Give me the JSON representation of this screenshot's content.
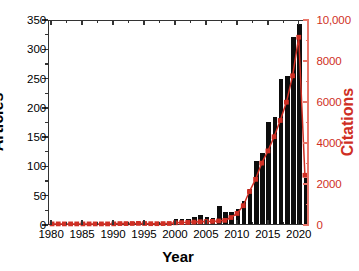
{
  "chart_data": {
    "type": "bar",
    "title": "",
    "xlabel": "Year",
    "ylabel": "Articles",
    "y2label": "Citations",
    "grid": false,
    "legend": "none",
    "xlim": [
      1979.5,
      2021.5
    ],
    "ylim": [
      0,
      350
    ],
    "y2lim": [
      0,
      10000
    ],
    "x_ticks": [
      "1980",
      "1985",
      "1990",
      "1995",
      "2000",
      "2005",
      "2010",
      "2015",
      "2020"
    ],
    "x_tick_values": [
      1980,
      1985,
      1990,
      1995,
      2000,
      2005,
      2010,
      2015,
      2020
    ],
    "y_ticks": [
      "0",
      "50",
      "100",
      "150",
      "200",
      "250",
      "300",
      "350"
    ],
    "y_tick_values": [
      0,
      50,
      100,
      150,
      200,
      250,
      300,
      350
    ],
    "y2_ticks": [
      "0",
      "2000",
      "4000",
      "6000",
      "8000",
      "10,000"
    ],
    "y2_tick_values": [
      0,
      2000,
      4000,
      6000,
      8000,
      10000
    ],
    "categories": [
      1980,
      1981,
      1982,
      1983,
      1984,
      1985,
      1986,
      1987,
      1988,
      1989,
      1990,
      1991,
      1992,
      1993,
      1994,
      1995,
      1996,
      1997,
      1998,
      1999,
      2000,
      2001,
      2002,
      2003,
      2004,
      2005,
      2006,
      2007,
      2008,
      2009,
      2010,
      2011,
      2012,
      2013,
      2014,
      2015,
      2016,
      2017,
      2018,
      2019,
      2020,
      2021
    ],
    "series": [
      {
        "name": "Articles",
        "type": "bar",
        "axis": "left",
        "color": "#0d0d0d",
        "values": [
          0,
          0,
          0,
          0,
          0,
          0,
          0,
          0,
          0,
          0,
          0,
          2,
          2,
          3,
          4,
          2,
          0,
          0,
          1,
          1,
          9,
          9,
          9,
          12,
          16,
          12,
          11,
          30,
          21,
          20,
          25,
          40,
          59,
          107,
          122,
          174,
          182,
          247,
          253,
          320,
          341,
          79
        ]
      },
      {
        "name": "Citations",
        "type": "line",
        "axis": "right",
        "color": "#cf2f24",
        "marker": "square",
        "values": [
          5,
          5,
          5,
          5,
          5,
          5,
          5,
          5,
          5,
          5,
          8,
          20,
          20,
          25,
          30,
          25,
          15,
          15,
          20,
          25,
          60,
          70,
          80,
          95,
          110,
          120,
          130,
          150,
          180,
          320,
          520,
          900,
          1600,
          2200,
          3000,
          3600,
          4300,
          5100,
          6000,
          7300,
          9200,
          2400
        ]
      }
    ]
  }
}
